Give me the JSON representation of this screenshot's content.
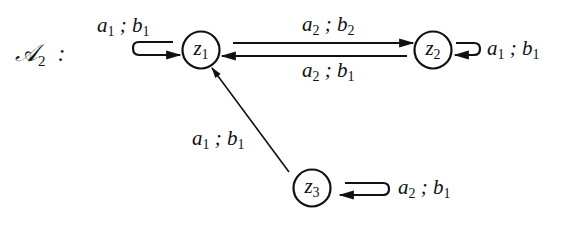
{
  "automaton": {
    "name": "𝒜",
    "index": "2",
    "colon": ":"
  },
  "states": [
    {
      "id": "z1",
      "base": "z",
      "sub": "1"
    },
    {
      "id": "z2",
      "base": "z",
      "sub": "2"
    },
    {
      "id": "z3",
      "base": "z",
      "sub": "3"
    }
  ],
  "transitions": [
    {
      "from": "z1",
      "to": "z1",
      "in": "a",
      "in_sub": "1",
      "out": "b",
      "out_sub": "1",
      "sep": " ; "
    },
    {
      "from": "z1",
      "to": "z2",
      "in": "a",
      "in_sub": "2",
      "out": "b",
      "out_sub": "2",
      "sep": " ; "
    },
    {
      "from": "z2",
      "to": "z1",
      "in": "a",
      "in_sub": "2",
      "out": "b",
      "out_sub": "1",
      "sep": " ; "
    },
    {
      "from": "z2",
      "to": "z2",
      "in": "a",
      "in_sub": "1",
      "out": "b",
      "out_sub": "1",
      "sep": " ; "
    },
    {
      "from": "z3",
      "to": "z1",
      "in": "a",
      "in_sub": "1",
      "out": "b",
      "out_sub": "1",
      "sep": " ; "
    },
    {
      "from": "z3",
      "to": "z3",
      "in": "a",
      "in_sub": "2",
      "out": "b",
      "out_sub": "1",
      "sep": " ; "
    }
  ]
}
